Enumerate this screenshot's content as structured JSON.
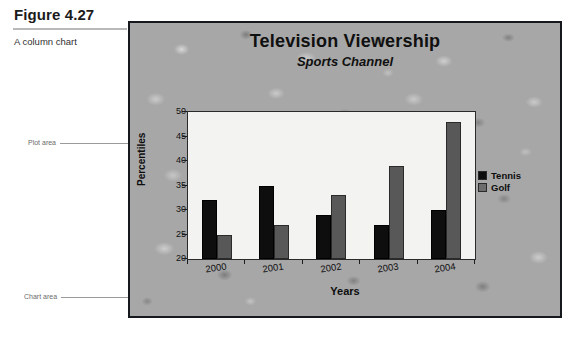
{
  "figure": {
    "caption": "Figure 4.27",
    "subcaption": "A column chart"
  },
  "callouts": {
    "plot_area": "Plot area",
    "chart_area": "Chart area"
  },
  "legend": {
    "position": "right",
    "entries": [
      {
        "label": "Tennis",
        "swatch": "tennis",
        "color": "#0e0e0e"
      },
      {
        "label": "Golf",
        "swatch": "golf",
        "color": "#6d6d6d"
      }
    ]
  },
  "chart_data": {
    "type": "bar",
    "title": "Television Viewership",
    "subtitle": "Sports Channel",
    "xlabel": "Years",
    "ylabel": "Percentiles",
    "categories": [
      "2000",
      "2001",
      "2002",
      "2003",
      "2004"
    ],
    "series": [
      {
        "name": "Tennis",
        "values": [
          32,
          35,
          29,
          27,
          30
        ],
        "color": "#0e0e0e"
      },
      {
        "name": "Golf",
        "values": [
          25,
          27,
          33,
          39,
          48
        ],
        "color": "#585858"
      }
    ],
    "ylim": [
      20,
      50
    ],
    "yticks": [
      20,
      25,
      30,
      35,
      40,
      45,
      50
    ],
    "grid": false,
    "legend_position": "right",
    "plot_background": "#f3f3f1",
    "chart_background_texture": "gray-stone"
  }
}
